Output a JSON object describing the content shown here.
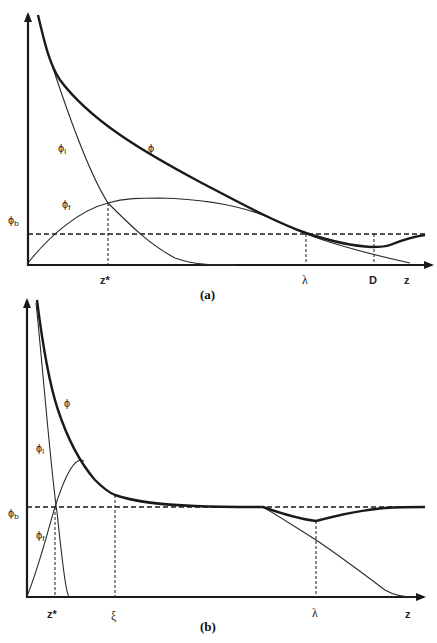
{
  "figure": {
    "panels": [
      {
        "id": "a",
        "panel_label": "(a)",
        "axis": {
          "x_label": "z"
        },
        "curves": {
          "phi": "ϕ",
          "phi_l": {
            "base": "ϕ",
            "sub": "l"
          },
          "phi_f": {
            "base": "ϕ",
            "sub": "f"
          },
          "phi_b": {
            "base": "ϕ",
            "sub": "b"
          }
        },
        "markers": {
          "z_star": "z*",
          "lambda": "λ",
          "D": "D"
        }
      },
      {
        "id": "b",
        "panel_label": "(b)",
        "axis": {
          "x_label": "z"
        },
        "curves": {
          "phi": "ϕ",
          "phi_l": {
            "base": "ϕ",
            "sub": "l"
          },
          "phi_f": {
            "base": "ϕ",
            "sub": "f"
          },
          "phi_b": {
            "base": "ϕ",
            "sub": "b"
          }
        },
        "markers": {
          "z_star": "z*",
          "xi": "ξ",
          "lambda": "λ"
        }
      }
    ]
  }
}
